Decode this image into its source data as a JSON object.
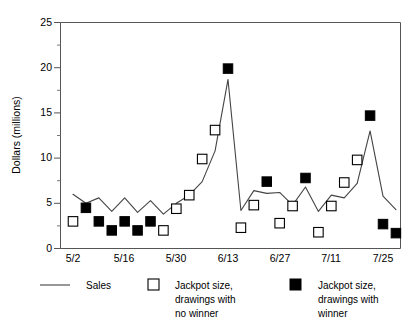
{
  "chart_data": {
    "type": "line",
    "title": "",
    "xlabel": "",
    "ylabel": "Dollars (millions)",
    "ylim": [
      0,
      25
    ],
    "yticks": [
      0,
      5,
      10,
      15,
      20,
      25
    ],
    "yticklabels": [
      "0",
      "5",
      "10",
      "15",
      "20",
      "25"
    ],
    "minor_yticks": [
      2.5,
      7.5,
      12.5,
      17.5,
      22.5
    ],
    "grid": false,
    "legend_position": "below-axes",
    "xticklabels": [
      "5/2",
      "5/16",
      "5/30",
      "6/13",
      "6/27",
      "7/11",
      "7/25"
    ],
    "xtick_indices": [
      0,
      4,
      8,
      12,
      16,
      20,
      24
    ],
    "x": [
      "5/2",
      "5/5",
      "5/9",
      "5/12",
      "5/16",
      "5/19",
      "5/23",
      "5/26",
      "5/30",
      "6/2",
      "6/6",
      "6/9",
      "6/13",
      "6/16",
      "6/20",
      "6/23",
      "6/27",
      "6/30",
      "7/4",
      "7/7",
      "7/11",
      "7/14",
      "7/18",
      "7/21",
      "7/25",
      "7/28"
    ],
    "series": [
      {
        "name": "Sales",
        "type": "line",
        "values": [
          6.0,
          5.0,
          5.6,
          4.1,
          5.6,
          4.0,
          5.3,
          3.8,
          5.0,
          5.9,
          7.4,
          10.8,
          18.7,
          4.2,
          6.4,
          6.1,
          6.2,
          4.8,
          6.8,
          4.1,
          5.9,
          5.6,
          7.2,
          13.0,
          5.8,
          4.3
        ]
      },
      {
        "name": "Jackpot size, drawings with no winner",
        "type": "scatter",
        "marker": "open-square",
        "points": [
          {
            "x": "5/2",
            "y": 3.0
          },
          {
            "x": "5/26",
            "y": 2.0
          },
          {
            "x": "5/30",
            "y": 4.4
          },
          {
            "x": "6/2",
            "y": 5.9
          },
          {
            "x": "6/6",
            "y": 9.9
          },
          {
            "x": "6/9",
            "y": 13.1
          },
          {
            "x": "6/16",
            "y": 2.3
          },
          {
            "x": "6/20",
            "y": 4.8
          },
          {
            "x": "6/30",
            "y": 4.7
          },
          {
            "x": "6/27",
            "y": 2.8
          },
          {
            "x": "7/7",
            "y": 1.8
          },
          {
            "x": "7/11",
            "y": 4.7
          },
          {
            "x": "7/14",
            "y": 7.3
          },
          {
            "x": "7/18",
            "y": 9.8
          }
        ]
      },
      {
        "name": "Jackpot size, drawings with winner",
        "type": "scatter",
        "marker": "filled-square",
        "points": [
          {
            "x": "5/5",
            "y": 4.5
          },
          {
            "x": "5/9",
            "y": 3.0
          },
          {
            "x": "5/12",
            "y": 2.0
          },
          {
            "x": "5/16",
            "y": 3.0
          },
          {
            "x": "5/19",
            "y": 2.0
          },
          {
            "x": "5/23",
            "y": 3.0
          },
          {
            "x": "6/13",
            "y": 19.9
          },
          {
            "x": "6/23",
            "y": 7.4
          },
          {
            "x": "7/4",
            "y": 7.8
          },
          {
            "x": "7/21",
            "y": 14.7
          },
          {
            "x": "7/25",
            "y": 2.7
          },
          {
            "x": "7/28",
            "y": 1.7
          }
        ]
      }
    ]
  },
  "axes": {
    "ylabel": "Dollars (millions)",
    "ytick_0": "0",
    "ytick_1": "5",
    "ytick_2": "10",
    "ytick_3": "15",
    "ytick_4": "20",
    "ytick_5": "25",
    "xtick_0": "5/2",
    "xtick_1": "5/16",
    "xtick_2": "5/30",
    "xtick_3": "6/13",
    "xtick_4": "6/27",
    "xtick_5": "7/11",
    "xtick_6": "7/25"
  },
  "legend": {
    "items": [
      {
        "key": "sales",
        "marker": "line",
        "line1": "Sales",
        "line2": "",
        "line3": ""
      },
      {
        "key": "no-winner",
        "marker": "open-square",
        "line1": "Jackpot size,",
        "line2": "drawings with",
        "line3": "no winner"
      },
      {
        "key": "winner",
        "marker": "filled-square",
        "line1": "Jackpot size,",
        "line2": "drawings with",
        "line3": "winner"
      }
    ],
    "sales_label": "Sales",
    "no_winner_l1": "Jackpot size,",
    "no_winner_l2": "drawings with",
    "no_winner_l3": "no winner",
    "winner_l1": "Jackpot size,",
    "winner_l2": "drawings with",
    "winner_l3": "winner"
  },
  "colors": {
    "line": "#444444",
    "axis": "#555555",
    "marker_fill": "#000000",
    "marker_open": "#ffffff",
    "background": "#ffffff"
  }
}
